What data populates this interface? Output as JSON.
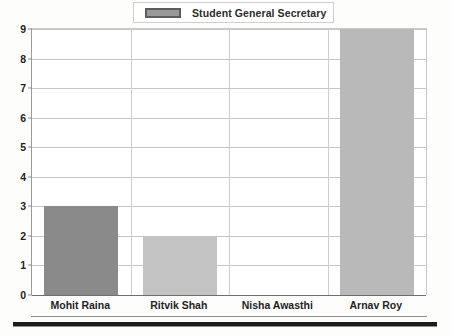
{
  "legend": {
    "label": "Student General Secretary",
    "swatch_color": "#9a9a9a",
    "swatch_border": "#5d5d5d"
  },
  "chart_data": {
    "type": "bar",
    "title": "",
    "subtitle": "",
    "xlabel": "",
    "ylabel": "",
    "categories": [
      "Mohit Raina",
      "Ritvik Shah",
      "Nisha Awasthi",
      "Arnav Roy"
    ],
    "values": [
      3,
      2,
      0,
      9
    ],
    "series": [
      {
        "name": "Student General Secretary",
        "values": [
          3,
          2,
          0,
          9
        ]
      }
    ],
    "bar_colors": [
      "#8a8a8a",
      "#c3c3c3",
      "none",
      "#b9b9b9"
    ],
    "ylim": [
      0,
      9
    ],
    "yticks": [
      0,
      1,
      2,
      3,
      4,
      5,
      6,
      7,
      8,
      9
    ],
    "ytick_labels": [
      "0",
      "1",
      "2",
      "3",
      "4",
      "5",
      "6",
      "7",
      "8",
      "9"
    ],
    "grid": true,
    "grid_axis": "both",
    "legend_position": "top-center",
    "annotations": []
  }
}
